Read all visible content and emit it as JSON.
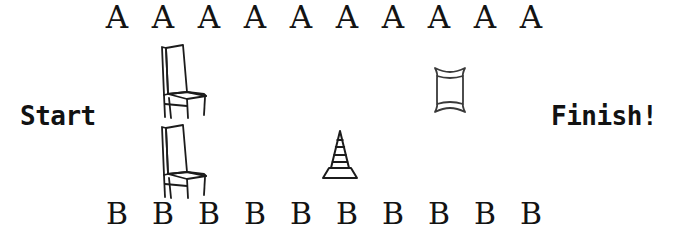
{
  "scene": {
    "title": "Relay race course layout",
    "background_color": "#ffffff",
    "ink_color": "#1a1a1a",
    "width": 680,
    "height": 244
  },
  "labels": {
    "start": "Start",
    "finish": "Finish!"
  },
  "rows": {
    "team_a": {
      "label": "A",
      "count": 10,
      "markers": [
        "A",
        "A",
        "A",
        "A",
        "A",
        "A",
        "A",
        "A",
        "A",
        "A"
      ]
    },
    "team_b": {
      "label": "B",
      "count": 10,
      "markers": [
        "B",
        "B",
        "B",
        "B",
        "B",
        "B",
        "B",
        "B",
        "B",
        "B"
      ]
    }
  },
  "objects": [
    {
      "name": "chair",
      "icon": "chair-icon",
      "position": "upper-left-course"
    },
    {
      "name": "chair",
      "icon": "chair-icon",
      "position": "lower-left-course"
    },
    {
      "name": "traffic cone",
      "icon": "traffic-cone-icon",
      "position": "center-course"
    },
    {
      "name": "pillow",
      "icon": "pillow-icon",
      "position": "upper-right-course"
    }
  ]
}
